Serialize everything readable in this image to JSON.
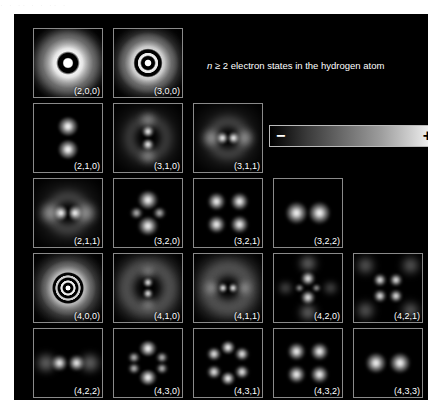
{
  "top_artifact": "· ·   ·· ·   · ·· ·",
  "figure": {
    "title": "n ≥ 2 electron states in the hydrogen atom",
    "title_italic_symbol": "n",
    "background_color": "#000000",
    "canvas_background": "#ffffff"
  },
  "colorbar": {
    "name": "probability-amplitude-scale",
    "min_label": "−",
    "max_label": "+",
    "min_color": "#000000",
    "max_color": "#ffffff",
    "orientation": "horizontal"
  },
  "chart_data": {
    "type": "heatmap",
    "title": "n ≥ 2 electron states in the hydrogen atom",
    "xlabel": "",
    "ylabel": "",
    "colormap": "grayscale",
    "colorbar_range_labels": [
      "−",
      "+"
    ],
    "panel_label_format": "(n,l,m)",
    "rows": [
      {
        "row": 1,
        "panels": [
          {
            "label": "(2,0,0)",
            "n": 2,
            "l": 0,
            "m": 0,
            "shape": "s-shell",
            "nodes": 1
          },
          {
            "label": "(3,0,0)",
            "n": 3,
            "l": 0,
            "m": 0,
            "shape": "s-shell",
            "nodes": 2
          }
        ]
      },
      {
        "row": 2,
        "panels": [
          {
            "label": "(2,1,0)",
            "n": 2,
            "l": 1,
            "m": 0,
            "shape": "p-dumbbell-vertical",
            "nodes": 0
          },
          {
            "label": "(3,1,0)",
            "n": 3,
            "l": 1,
            "m": 0,
            "shape": "p-dumbbell-vertical",
            "nodes": 1
          },
          {
            "label": "(3,1,1)",
            "n": 3,
            "l": 1,
            "m": 1,
            "shape": "p-torus",
            "nodes": 1
          }
        ]
      },
      {
        "row": 3,
        "panels": [
          {
            "label": "(2,1,1)",
            "n": 2,
            "l": 1,
            "m": 1,
            "shape": "p-torus",
            "nodes": 0
          },
          {
            "label": "(3,2,0)",
            "n": 3,
            "l": 2,
            "m": 0,
            "shape": "d-z2-bowtie",
            "nodes": 0
          },
          {
            "label": "(3,2,1)",
            "n": 3,
            "l": 2,
            "m": 1,
            "shape": "d-cloverleaf",
            "nodes": 0
          },
          {
            "label": "(3,2,2)",
            "n": 3,
            "l": 2,
            "m": 2,
            "shape": "d-torus",
            "nodes": 0
          }
        ]
      },
      {
        "row": 4,
        "panels": [
          {
            "label": "(4,0,0)",
            "n": 4,
            "l": 0,
            "m": 0,
            "shape": "s-shell",
            "nodes": 3
          },
          {
            "label": "(4,1,0)",
            "n": 4,
            "l": 1,
            "m": 0,
            "shape": "p-dumbbell-vertical",
            "nodes": 2
          },
          {
            "label": "(4,1,1)",
            "n": 4,
            "l": 1,
            "m": 1,
            "shape": "p-torus",
            "nodes": 2
          },
          {
            "label": "(4,2,0)",
            "n": 4,
            "l": 2,
            "m": 0,
            "shape": "d-z2-bowtie",
            "nodes": 1
          },
          {
            "label": "(4,2,1)",
            "n": 4,
            "l": 2,
            "m": 1,
            "shape": "d-cloverleaf",
            "nodes": 1
          }
        ]
      },
      {
        "row": 5,
        "panels": [
          {
            "label": "(4,2,2)",
            "n": 4,
            "l": 2,
            "m": 2,
            "shape": "d-torus",
            "nodes": 1
          },
          {
            "label": "(4,3,0)",
            "n": 4,
            "l": 3,
            "m": 0,
            "shape": "f-multilobe-vertical",
            "nodes": 0
          },
          {
            "label": "(4,3,1)",
            "n": 4,
            "l": 3,
            "m": 1,
            "shape": "f-six-lobe",
            "nodes": 0
          },
          {
            "label": "(4,3,2)",
            "n": 4,
            "l": 3,
            "m": 2,
            "shape": "f-cloverleaf",
            "nodes": 0
          },
          {
            "label": "(4,3,3)",
            "n": 4,
            "l": 3,
            "m": 3,
            "shape": "f-torus",
            "nodes": 0
          }
        ]
      }
    ]
  }
}
